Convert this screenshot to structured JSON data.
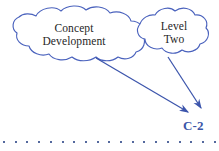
{
  "slide": {
    "type": "concept-diagram",
    "background_color": "#ffffff",
    "width": 219,
    "height": 151
  },
  "clouds": [
    {
      "id": "cloud-concept-development",
      "label": "Concept\nDevelopment",
      "line_color": "#4a62bd",
      "fill_color": "#ffffff",
      "center": [
        76,
        35
      ],
      "bbox": [
        10,
        8,
        135,
        54
      ]
    },
    {
      "id": "cloud-level-two",
      "label": "Level\nTwo",
      "line_color": "#4a62bd",
      "fill_color": "#ffffff",
      "center": [
        173,
        34
      ],
      "bbox": [
        136,
        9,
        74,
        51
      ]
    }
  ],
  "arrows": [
    {
      "id": "arrow-concept-to-target",
      "from_cloud": "cloud-concept-development",
      "start": [
        96,
        58
      ],
      "end": [
        191,
        114
      ],
      "color": "#3c55ac"
    },
    {
      "id": "arrow-level-two-to-target",
      "from_cloud": "cloud-level-two",
      "start": [
        168,
        57
      ],
      "end": [
        203,
        111
      ],
      "color": "#3c55ac"
    }
  ],
  "page_label": {
    "text": "C-2",
    "color": "#3b55a8"
  },
  "dot_rule": {
    "color": "#54699e",
    "dot_count": 19,
    "spacing": 11.7,
    "start_x": 3,
    "y": 141
  }
}
